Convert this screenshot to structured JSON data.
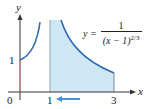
{
  "diagram": {
    "axes": {
      "x_label": "x",
      "y_label": "y"
    },
    "ticks": {
      "x": [
        "0",
        "1",
        "3"
      ],
      "y": [
        "1"
      ]
    },
    "equation": {
      "lhs": "y =",
      "numerator": "1",
      "denominator_base": "(x − 1)",
      "denominator_exponent": "2/3"
    },
    "shaded_interval": [
      1,
      3
    ],
    "arrow_direction": "left",
    "colors": {
      "curve": "#2b6cb0",
      "fill": "#cfe6f5",
      "axis": "#333333",
      "arrow": "#4a90d9",
      "y_axis_segment": "#d98080"
    }
  }
}
